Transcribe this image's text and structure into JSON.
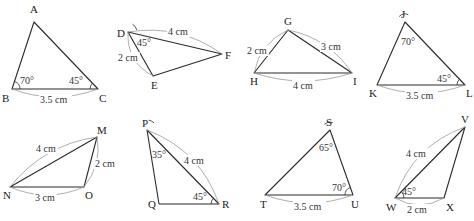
{
  "figure": {
    "corner_fragment": "",
    "colors": {
      "edge": "#2a2a2a",
      "dimension_arc": "#9a9a9a",
      "text": "#222222"
    }
  },
  "triangles": [
    {
      "id": "ABC",
      "vertices": [
        {
          "name": "A",
          "x": 34,
          "y": 22,
          "lx": 30,
          "ly": 13
        },
        {
          "name": "B",
          "x": 12,
          "y": 89,
          "lx": 2,
          "ly": 102
        },
        {
          "name": "C",
          "x": 98,
          "y": 89,
          "lx": 99,
          "ly": 102
        }
      ],
      "angles": [
        {
          "at": "B",
          "label": "70°",
          "lx": 20,
          "ly": 84,
          "r": 8,
          "from": 0,
          "to": 72
        },
        {
          "at": "C",
          "label": "45°",
          "lx": 69,
          "ly": 84,
          "r": 8,
          "from": 135,
          "to": 180
        }
      ],
      "sides": [
        {
          "from": "B",
          "to": "C",
          "label": "3.5 cm",
          "lx": 40,
          "ly": 103,
          "bulge": 8,
          "side": "below"
        }
      ]
    },
    {
      "id": "DEF",
      "vertices": [
        {
          "name": "D",
          "x": 128,
          "y": 32,
          "lx": 117,
          "ly": 37
        },
        {
          "name": "E",
          "x": 153,
          "y": 76,
          "lx": 151,
          "ly": 89
        },
        {
          "name": "F",
          "x": 222,
          "y": 54,
          "lx": 225,
          "ly": 59
        }
      ],
      "angles": [
        {
          "at": "D",
          "label": "45°",
          "lx": 137,
          "ly": 46,
          "r": 9,
          "from": 13,
          "to": 60
        }
      ],
      "sides": [
        {
          "from": "D",
          "to": "F",
          "label": "4 cm",
          "lx": 168,
          "ly": 35,
          "bulge": 10,
          "side": "above"
        },
        {
          "from": "D",
          "to": "E",
          "label": "2 cm",
          "lx": 118,
          "ly": 61,
          "bulge": 8,
          "side": "left"
        }
      ]
    },
    {
      "id": "GHI",
      "vertices": [
        {
          "name": "G",
          "x": 288,
          "y": 30,
          "lx": 284,
          "ly": 25
        },
        {
          "name": "H",
          "x": 254,
          "y": 73,
          "lx": 250,
          "ly": 85
        },
        {
          "name": "I",
          "x": 352,
          "y": 73,
          "lx": 353,
          "ly": 85
        }
      ],
      "angles": [],
      "sides": [
        {
          "from": "H",
          "to": "G",
          "label": "2 cm",
          "lx": 247,
          "ly": 54,
          "bulge": 7,
          "side": "left"
        },
        {
          "from": "G",
          "to": "I",
          "label": "3 cm",
          "lx": 321,
          "ly": 50,
          "bulge": 8,
          "side": "right"
        },
        {
          "from": "H",
          "to": "I",
          "label": "4 cm",
          "lx": 293,
          "ly": 89,
          "bulge": 8,
          "side": "below"
        }
      ]
    },
    {
      "id": "JKL",
      "vertices": [
        {
          "name": "J",
          "x": 405,
          "y": 22,
          "lx": 401,
          "ly": 18
        },
        {
          "name": "K",
          "x": 377,
          "y": 85,
          "lx": 369,
          "ly": 97
        },
        {
          "name": "L",
          "x": 465,
          "y": 85,
          "lx": 466,
          "ly": 97
        }
      ],
      "angles": [
        {
          "at": "J",
          "label": "70°",
          "lx": 401,
          "ly": 45,
          "r": 8,
          "from": 66,
          "to": 137
        },
        {
          "at": "L",
          "label": "45°",
          "lx": 437,
          "ly": 82,
          "r": 8,
          "from": 135,
          "to": 180
        }
      ],
      "sides": [
        {
          "from": "K",
          "to": "L",
          "label": "3.5 cm",
          "lx": 406,
          "ly": 99,
          "bulge": 8,
          "side": "below"
        }
      ]
    },
    {
      "id": "MNO",
      "vertices": [
        {
          "name": "M",
          "x": 97,
          "y": 137,
          "lx": 97,
          "ly": 134
        },
        {
          "name": "N",
          "x": 10,
          "y": 187,
          "lx": 3,
          "ly": 199
        },
        {
          "name": "O",
          "x": 84,
          "y": 187,
          "lx": 85,
          "ly": 199
        }
      ],
      "angles": [],
      "sides": [
        {
          "from": "N",
          "to": "M",
          "label": "4 cm",
          "lx": 36,
          "ly": 152,
          "bulge": 10,
          "side": "above"
        },
        {
          "from": "O",
          "to": "M",
          "label": "2 cm",
          "lx": 95,
          "ly": 167,
          "bulge": 6,
          "side": "right"
        },
        {
          "from": "N",
          "to": "O",
          "label": "3 cm",
          "lx": 35,
          "ly": 201,
          "bulge": 8,
          "side": "below"
        }
      ]
    },
    {
      "id": "PQR",
      "vertices": [
        {
          "name": "P",
          "x": 147,
          "y": 130,
          "lx": 142,
          "ly": 127
        },
        {
          "name": "Q",
          "x": 159,
          "y": 204,
          "lx": 148,
          "ly": 208
        },
        {
          "name": "R",
          "x": 219,
          "y": 204,
          "lx": 222,
          "ly": 208
        }
      ],
      "angles": [
        {
          "at": "P",
          "label": "35°",
          "lx": 152,
          "ly": 158,
          "r": 10,
          "from": 45,
          "to": 81
        },
        {
          "at": "R",
          "label": "45°",
          "lx": 193,
          "ly": 200,
          "r": 8,
          "from": 135,
          "to": 180
        }
      ],
      "sides": [
        {
          "from": "P",
          "to": "R",
          "label": "4 cm",
          "lx": 184,
          "ly": 164,
          "bulge": 12,
          "side": "right"
        }
      ]
    },
    {
      "id": "STU",
      "vertices": [
        {
          "name": "S",
          "x": 330,
          "y": 130,
          "lx": 326,
          "ly": 126
        },
        {
          "name": "T",
          "x": 265,
          "y": 195,
          "lx": 260,
          "ly": 208
        },
        {
          "name": "U",
          "x": 353,
          "y": 195,
          "lx": 351,
          "ly": 208
        }
      ],
      "angles": [
        {
          "at": "S",
          "label": "65°",
          "lx": 319,
          "ly": 151,
          "r": 8,
          "from": 70,
          "to": 135
        },
        {
          "at": "U",
          "label": "70°",
          "lx": 332,
          "ly": 191,
          "r": 8,
          "from": 110,
          "to": 180
        }
      ],
      "sides": [
        {
          "from": "T",
          "to": "U",
          "label": "3.5 cm",
          "lx": 294,
          "ly": 210,
          "bulge": 8,
          "side": "below"
        }
      ]
    },
    {
      "id": "VWX",
      "vertices": [
        {
          "name": "V",
          "x": 465,
          "y": 127,
          "lx": 461,
          "ly": 123
        },
        {
          "name": "W",
          "x": 395,
          "y": 198,
          "lx": 386,
          "ly": 211
        },
        {
          "name": "X",
          "x": 444,
          "y": 198,
          "lx": 446,
          "ly": 211
        }
      ],
      "angles": [
        {
          "at": "W",
          "label": "45°",
          "lx": 402,
          "ly": 195,
          "r": 9,
          "from": 0,
          "to": 45
        }
      ],
      "sides": [
        {
          "from": "W",
          "to": "V",
          "label": "4 cm",
          "lx": 406,
          "ly": 157,
          "bulge": 12,
          "side": "above"
        },
        {
          "from": "W",
          "to": "X",
          "label": "2 cm",
          "lx": 407,
          "ly": 213,
          "bulge": 7,
          "side": "below"
        }
      ]
    }
  ]
}
